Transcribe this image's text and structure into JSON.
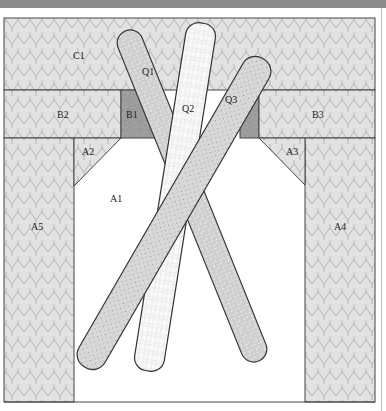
{
  "diagram": {
    "colors": {
      "header_bar": "#8c8c8c",
      "tile_fill": "#e2e2e2",
      "tile_stroke": "#b4b4b4",
      "dark_block": "#9a9a9a",
      "outline": "#444444",
      "bar_fill": "#d4d4d4",
      "white": "#ffffff"
    },
    "regions": [
      {
        "id": "C1",
        "label": "C1",
        "label_pos": [
          78,
          56
        ]
      },
      {
        "id": "B2",
        "label": "B2",
        "label_pos": [
          62,
          118
        ]
      },
      {
        "id": "B1",
        "label": "B1",
        "label_pos": [
          131,
          118
        ]
      },
      {
        "id": "B3",
        "label": "B3",
        "label_pos": [
          312,
          118
        ]
      },
      {
        "id": "A2",
        "label": "A2",
        "label_pos": [
          82,
          154
        ]
      },
      {
        "id": "A3",
        "label": "A3",
        "label_pos": [
          285,
          154
        ]
      },
      {
        "id": "A1",
        "label": "A1",
        "label_pos": [
          111,
          200
        ]
      },
      {
        "id": "A5",
        "label": "A5",
        "label_pos": [
          31,
          227
        ]
      },
      {
        "id": "A4",
        "label": "A4",
        "label_pos": [
          334,
          227
        ]
      }
    ],
    "bars": [
      {
        "id": "Q1",
        "label": "Q1",
        "label_pos": [
          142,
          74
        ],
        "pattern": "speckle"
      },
      {
        "id": "Q2",
        "label": "Q2",
        "label_pos": [
          182,
          111
        ],
        "pattern": "grid"
      },
      {
        "id": "Q3",
        "label": "Q3",
        "label_pos": [
          226,
          102
        ],
        "pattern": "dots"
      }
    ]
  }
}
